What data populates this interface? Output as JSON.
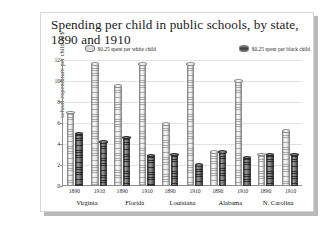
{
  "card": {
    "title": "Spending per child in public schools, by state, 1890 and 1910"
  },
  "legend": {
    "white": {
      "label": "$0.25 spent per white child",
      "swatch": "cylinder-white-icon"
    },
    "black": {
      "label": "$0.25 spent per black child",
      "swatch": "cylinder-black-icon"
    }
  },
  "chart_data": {
    "type": "bar",
    "title": "Spending per child in public schools, by state, 1890 and 1910",
    "xlabel": "",
    "ylabel": "school expenditure per child in $",
    "ylim": [
      0,
      12
    ],
    "yticks": [
      0,
      2,
      4,
      6,
      8,
      10,
      12
    ],
    "grid": true,
    "legend_position": "top",
    "categories": [
      "Virginia",
      "Florida",
      "Louisiana",
      "Alabama",
      "N. Carolina"
    ],
    "subcategories": [
      "1890",
      "1910"
    ],
    "series": [
      {
        "name": "$0.25 spent per white child",
        "values": {
          "1890": [
            7.0,
            9.5,
            5.9,
            3.2,
            3.0
          ],
          "1910": [
            11.6,
            11.6,
            11.6,
            10.0,
            5.2
          ]
        }
      },
      {
        "name": "$0.25 spent per black child",
        "values": {
          "1890": [
            5.0,
            4.6,
            3.0,
            3.2,
            3.0
          ],
          "1910": [
            4.2,
            2.9,
            2.0,
            2.7,
            3.0
          ]
        }
      }
    ]
  }
}
